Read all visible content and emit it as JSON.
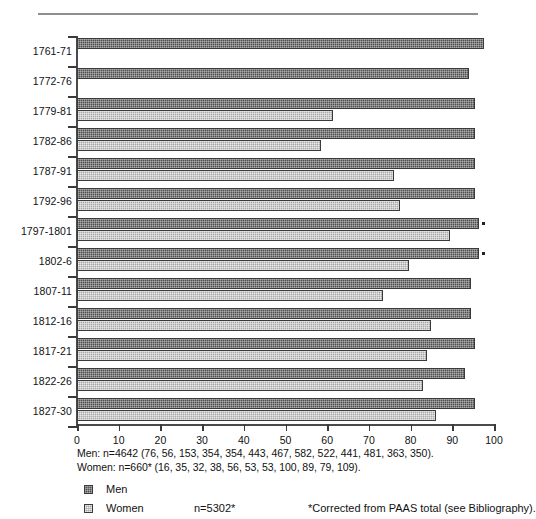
{
  "chart_data": {
    "type": "bar",
    "orientation": "horizontal",
    "title": "",
    "xlabel": "",
    "ylabel": "",
    "xlim": [
      0,
      100
    ],
    "xticks": [
      0,
      10,
      20,
      30,
      40,
      50,
      60,
      70,
      80,
      90,
      100
    ],
    "grid": false,
    "legend_position": "bottom-left",
    "categories": [
      "1761-71",
      "1772-76",
      "1779-81",
      "1782-86",
      "1787-91",
      "1792-96",
      "1797-1801",
      "1802-6",
      "1807-11",
      "1812-16",
      "1817-21",
      "1822-26",
      "1827-30"
    ],
    "series": [
      {
        "name": "Men",
        "color": "#4f4f4f",
        "values": [
          97.5,
          94.0,
          95.5,
          95.5,
          95.5,
          95.5,
          96.5,
          96.5,
          94.5,
          94.5,
          95.5,
          93.0,
          95.5
        ]
      },
      {
        "name": "Women",
        "color": "#a8a8a8",
        "values": [
          0,
          0,
          61.5,
          58.5,
          76.0,
          77.5,
          89.5,
          79.5,
          73.5,
          85.0,
          84.0,
          83.0,
          86.0
        ]
      }
    ],
    "annotations": [
      "Marker dot at end of Men bars for 1797-1801 and 1802-6"
    ]
  },
  "axis": {
    "tick_labels": [
      "0",
      "10",
      "20",
      "30",
      "40",
      "50",
      "60",
      "70",
      "80",
      "90",
      "100"
    ],
    "category_labels": [
      "1761-71",
      "1772-76",
      "1779-81",
      "1782-86",
      "1787-91",
      "1792-96",
      "1797-1801",
      "1802-6",
      "1807-11",
      "1812-16",
      "1817-21",
      "1822-26",
      "1827-30"
    ]
  },
  "notes": {
    "men": "Men: n=4642 (76, 56, 153, 354, 354, 443, 467, 582, 522, 441, 481, 363, 350).",
    "women": "Women: n=660* (16, 35, 32, 38, 56, 53, 53, 100, 89, 79, 109)."
  },
  "legend": {
    "men_label": "Men",
    "women_label": "Women",
    "total_count": "n=5302*",
    "footnote": "*Corrected from PAAS total (see Bibliography)."
  },
  "colors": {
    "men": "#4f4f4f",
    "women": "#a8a8a8",
    "axis": "#3a3a3a",
    "rule": "#8e8e8e"
  }
}
